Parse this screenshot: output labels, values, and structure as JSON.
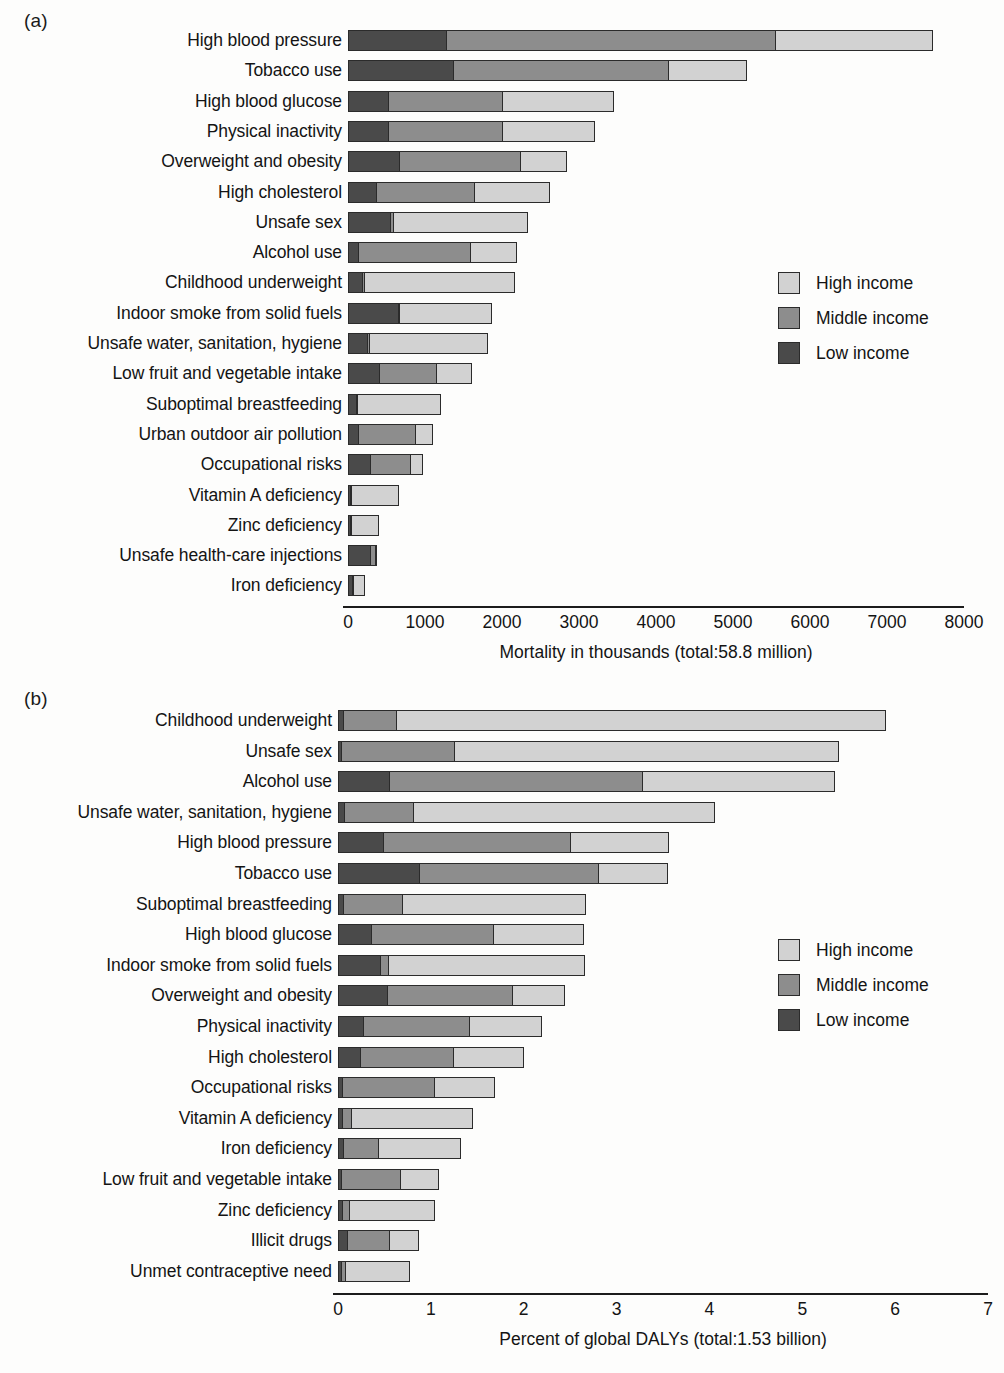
{
  "figure": {
    "panel_a_letter": "(a)",
    "panel_b_letter": "(b)"
  },
  "legend": {
    "position": "right-middle",
    "items": [
      {
        "key": "high",
        "label": "High income",
        "color": "#d2d2d2"
      },
      {
        "key": "middle",
        "label": "Middle income",
        "color": "#8d8d8d"
      },
      {
        "key": "low",
        "label": "Low income",
        "color": "#4a4a4a"
      }
    ]
  },
  "chart_data": [
    {
      "id": "panel-a",
      "type": "bar",
      "orientation": "horizontal",
      "stacked": true,
      "title": "",
      "xlabel": "Mortality in thousands (total:58.8 million)",
      "ylabel": "",
      "xlim": [
        0,
        8000
      ],
      "xticks": [
        0,
        1000,
        2000,
        3000,
        4000,
        5000,
        6000,
        7000,
        8000
      ],
      "xticklabels": [
        "0",
        "1000",
        "2000",
        "3000",
        "4000",
        "5000",
        "6000",
        "7000",
        "8000"
      ],
      "grid": false,
      "legend_entries": [
        "High income",
        "Middle income",
        "Low income"
      ],
      "categories": [
        "High blood pressure",
        "Tobacco use",
        "High blood glucose",
        "Physical inactivity",
        "Overweight and obesity",
        "High cholesterol",
        "Unsafe sex",
        "Alcohol use",
        "Childhood underweight",
        "Indoor smoke from solid fuels",
        "Unsafe water, sanitation, hygiene",
        "Low fruit and vegetable intake",
        "Suboptimal breastfeeding",
        "Urban outdoor air pollution",
        "Occupational risks",
        "Vitamin A deficiency",
        "Zinc deficiency",
        "Unsafe health-care injections",
        "Iron deficiency"
      ],
      "series": [
        {
          "name": "Low income",
          "values": [
            1270,
            1360,
            520,
            520,
            660,
            360,
            540,
            130,
            180,
            650,
            250,
            400,
            100,
            130,
            280,
            30,
            20,
            280,
            50
          ]
        },
        {
          "name": "Middle income",
          "values": [
            4270,
            2800,
            1480,
            1480,
            1580,
            1280,
            40,
            1460,
            30,
            10,
            20,
            740,
            20,
            740,
            530,
            10,
            10,
            70,
            20
          ]
        },
        {
          "name": "High income",
          "values": [
            2060,
            1020,
            1450,
            1210,
            610,
            990,
            1760,
            610,
            1960,
            1210,
            1550,
            470,
            1090,
            230,
            170,
            620,
            370,
            30,
            150
          ]
        }
      ],
      "totals": [
        7600,
        5180,
        3450,
        3210,
        2850,
        2630,
        2340,
        2200,
        2170,
        1870,
        1820,
        1610,
        1210,
        1100,
        980,
        660,
        400,
        380,
        220
      ]
    },
    {
      "id": "panel-b",
      "type": "bar",
      "orientation": "horizontal",
      "stacked": true,
      "title": "",
      "xlabel": "Percent of global DALYs (total:1.53 billion)",
      "ylabel": "",
      "xlim": [
        0,
        7
      ],
      "xticks": [
        0,
        1,
        2,
        3,
        4,
        5,
        6,
        7
      ],
      "xticklabels": [
        "0",
        "1",
        "2",
        "3",
        "4",
        "5",
        "6",
        "7"
      ],
      "grid": false,
      "legend_entries": [
        "High income",
        "Middle income",
        "Low income"
      ],
      "categories": [
        "Childhood underweight",
        "Unsafe sex",
        "Alcohol use",
        "Unsafe water, sanitation, hygiene",
        "High blood pressure",
        "Tobacco use",
        "Suboptimal breastfeeding",
        "High blood glucose",
        "Indoor smoke from solid fuels",
        "Overweight and obesity",
        "Physical inactivity",
        "High cholesterol",
        "Occupational risks",
        "Vitamin A deficiency",
        "Iron deficiency",
        "Low fruit and vegetable intake",
        "Zinc deficiency",
        "Illicit drugs",
        "Unmet contraceptive need"
      ],
      "series": [
        {
          "name": "Low income",
          "values": [
            0.05,
            0.03,
            0.55,
            0.06,
            0.48,
            0.87,
            0.05,
            0.35,
            0.45,
            0.53,
            0.27,
            0.24,
            0.04,
            0.04,
            0.05,
            0.03,
            0.04,
            0.1,
            0.03
          ]
        },
        {
          "name": "Middle income",
          "values": [
            0.58,
            1.22,
            2.72,
            0.75,
            2.02,
            1.93,
            0.64,
            1.32,
            0.09,
            1.34,
            1.14,
            1.0,
            0.99,
            0.1,
            0.38,
            0.64,
            0.08,
            0.45,
            0.05
          ]
        },
        {
          "name": "High income",
          "values": [
            5.27,
            4.15,
            2.08,
            3.25,
            1.07,
            0.75,
            1.98,
            0.98,
            2.12,
            0.58,
            0.79,
            0.76,
            0.66,
            1.31,
            0.9,
            0.42,
            0.93,
            0.32,
            0.7
          ]
        }
      ],
      "totals": [
        5.9,
        5.4,
        5.35,
        4.06,
        3.57,
        3.55,
        2.67,
        2.65,
        2.66,
        2.45,
        2.2,
        2.0,
        1.69,
        1.45,
        1.33,
        1.09,
        1.05,
        0.87,
        0.78
      ]
    }
  ]
}
